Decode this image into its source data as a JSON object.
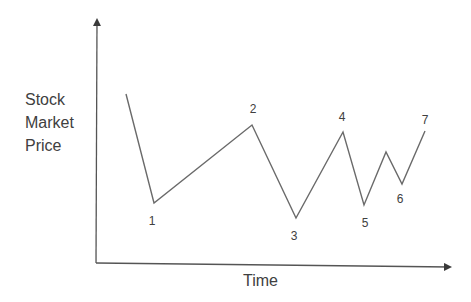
{
  "chart_data": {
    "type": "line",
    "title": "",
    "xlabel": "Time",
    "ylabel": "Stock Market Price",
    "ylabel_lines": [
      "Stock",
      "Market",
      "Price"
    ],
    "grid": false,
    "legend": null,
    "axes": {
      "origin": [
        96,
        263
      ],
      "y_axis_top": [
        97,
        20
      ],
      "x_axis_right": [
        450,
        267
      ],
      "color": "#555555"
    },
    "line_color": "#6a6a6a",
    "points": [
      {
        "label": "",
        "x": 126,
        "y": 94
      },
      {
        "label": "1",
        "x": 154,
        "y": 203,
        "label_x": 152,
        "label_y": 225
      },
      {
        "label": "2",
        "x": 252,
        "y": 125,
        "label_x": 253,
        "label_y": 113
      },
      {
        "label": "3",
        "x": 296,
        "y": 218,
        "label_x": 294,
        "label_y": 240
      },
      {
        "label": "4",
        "x": 343,
        "y": 132,
        "label_x": 342,
        "label_y": 121
      },
      {
        "label": "5",
        "x": 364,
        "y": 205,
        "label_x": 365,
        "label_y": 227
      },
      {
        "label": "",
        "x": 386,
        "y": 152
      },
      {
        "label": "6",
        "x": 402,
        "y": 184,
        "label_x": 400,
        "label_y": 203
      },
      {
        "label": "7",
        "x": 425,
        "y": 131,
        "label_x": 425,
        "label_y": 124
      }
    ],
    "relative_values": [
      {
        "label": "start",
        "value": 0.88
      },
      {
        "label": "1",
        "value": 0.35
      },
      {
        "label": "2",
        "value": 0.72
      },
      {
        "label": "3",
        "value": 0.24
      },
      {
        "label": "4",
        "value": 0.69
      },
      {
        "label": "5",
        "value": 0.33
      },
      {
        "label": "intermediate peak",
        "value": 0.6
      },
      {
        "label": "6",
        "value": 0.43
      },
      {
        "label": "7",
        "value": 0.69
      }
    ]
  },
  "labels": {
    "y_line1": "Stock",
    "y_line2": "Market",
    "y_line3": "Price",
    "x": "Time"
  }
}
